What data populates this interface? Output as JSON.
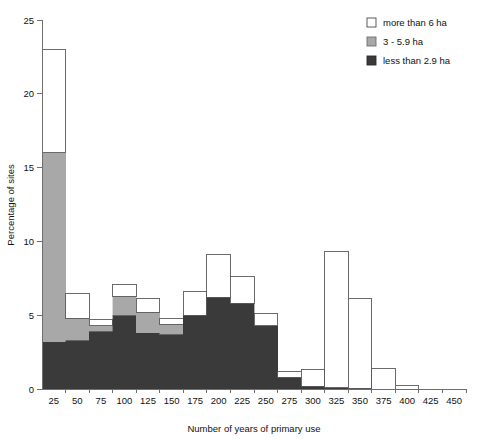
{
  "chart_data": {
    "type": "bar",
    "title": "",
    "subtitle": "",
    "xlabel": "Number of years of primary use",
    "ylabel": "Percentage of sites",
    "categories": [
      "25",
      "50",
      "75",
      "100",
      "125",
      "150",
      "175",
      "200",
      "225",
      "250",
      "275",
      "300",
      "325",
      "350",
      "375",
      "400",
      "425",
      "450"
    ],
    "xlim": [
      0,
      18
    ],
    "ylim": [
      0,
      25
    ],
    "yticks": [
      "0",
      "5",
      "10",
      "15",
      "20",
      "25"
    ],
    "grid": false,
    "stacked": true,
    "legend_position": "top-right",
    "series": [
      {
        "name": "less than 2.9 ha",
        "color": "#3a3a3a",
        "values": [
          3.2,
          3.3,
          3.9,
          5.0,
          3.8,
          3.7,
          5.0,
          6.2,
          5.8,
          4.3,
          0.8,
          0.2,
          0.1,
          0.05,
          0.0,
          0.0,
          0.0,
          0.0
        ]
      },
      {
        "name": "3 - 5.9 ha",
        "color": "#a8a8a8",
        "values": [
          12.8,
          1.5,
          0.4,
          1.3,
          1.4,
          0.7,
          0.0,
          0.0,
          0.0,
          0.0,
          0.0,
          0.0,
          0.0,
          0.0,
          0.0,
          0.0,
          0.0,
          0.0
        ]
      },
      {
        "name": "more than 6 ha",
        "color": "#ffffff",
        "values": [
          7.0,
          1.7,
          0.4,
          0.8,
          0.9,
          0.4,
          1.6,
          2.9,
          1.8,
          0.8,
          0.4,
          1.1,
          9.2,
          6.1,
          1.4,
          0.25,
          0.0,
          0.0
        ]
      }
    ],
    "totals": [
      23.0,
      6.5,
      4.7,
      7.1,
      6.1,
      4.8,
      6.6,
      9.1,
      7.6,
      5.1,
      1.2,
      1.3,
      9.3,
      6.15,
      1.4,
      0.25,
      0.0,
      0.0
    ]
  },
  "legend": {
    "items": [
      {
        "label": "more than 6 ha",
        "swatch": "#ffffff",
        "stroke": "#4a4a4a"
      },
      {
        "label": "3 - 5.9 ha",
        "swatch": "#a8a8a8",
        "stroke": "#6f6f6f"
      },
      {
        "label": "less than 2.9 ha",
        "swatch": "#3a3a3a",
        "stroke": "#2a2a2a"
      }
    ]
  },
  "axes": {
    "x_title": "Number of years of primary use",
    "y_title": "Percentage of sites"
  }
}
